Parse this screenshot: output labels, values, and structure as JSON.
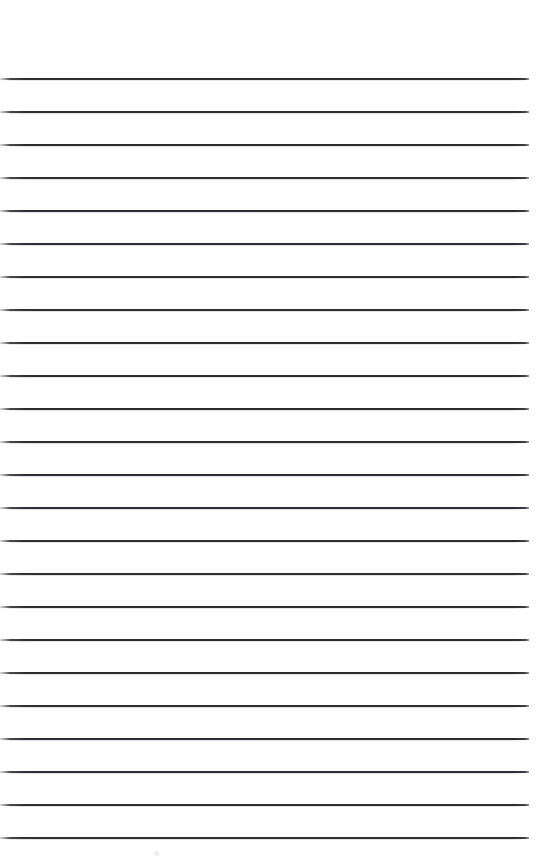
{
  "page": {
    "kind": "scanned-blank-ruled-notebook-page",
    "width": 536,
    "height": 863,
    "background_color": "#ffffff",
    "rule_color": "#2e2e32",
    "rule_faded_edge_color": "#78787c",
    "rule_thickness_px": 2,
    "rule_spacing_px": 33,
    "top_margin_px": 78,
    "bottom_margin_px": 27,
    "rule_left_x": 0,
    "rule_right_x": 529,
    "rule_count": 24,
    "text_content": "",
    "notes_visible": "none - page is blank, no handwriting or printed text"
  },
  "rules": [
    {
      "index": 1,
      "y": 78,
      "left": 0,
      "width": 529
    },
    {
      "index": 2,
      "y": 111,
      "left": 0,
      "width": 529
    },
    {
      "index": 3,
      "y": 144,
      "left": 0,
      "width": 529
    },
    {
      "index": 4,
      "y": 177,
      "left": 0,
      "width": 529
    },
    {
      "index": 5,
      "y": 210,
      "left": 0,
      "width": 529
    },
    {
      "index": 6,
      "y": 243,
      "left": 0,
      "width": 529
    },
    {
      "index": 7,
      "y": 276,
      "left": 0,
      "width": 529
    },
    {
      "index": 8,
      "y": 309,
      "left": 0,
      "width": 529
    },
    {
      "index": 9,
      "y": 342,
      "left": 0,
      "width": 529
    },
    {
      "index": 10,
      "y": 375,
      "left": 0,
      "width": 529
    },
    {
      "index": 11,
      "y": 408,
      "left": 0,
      "width": 529
    },
    {
      "index": 12,
      "y": 441,
      "left": 0,
      "width": 529
    },
    {
      "index": 13,
      "y": 474,
      "left": 0,
      "width": 529
    },
    {
      "index": 14,
      "y": 507,
      "left": 0,
      "width": 529
    },
    {
      "index": 15,
      "y": 540,
      "left": 0,
      "width": 529
    },
    {
      "index": 16,
      "y": 573,
      "left": 0,
      "width": 529
    },
    {
      "index": 17,
      "y": 606,
      "left": 0,
      "width": 529
    },
    {
      "index": 18,
      "y": 639,
      "left": 0,
      "width": 529
    },
    {
      "index": 19,
      "y": 672,
      "left": 0,
      "width": 529
    },
    {
      "index": 20,
      "y": 705,
      "left": 0,
      "width": 529
    },
    {
      "index": 21,
      "y": 738,
      "left": 0,
      "width": 529
    },
    {
      "index": 22,
      "y": 771,
      "left": 0,
      "width": 529
    },
    {
      "index": 23,
      "y": 804,
      "left": 0,
      "width": 529
    },
    {
      "index": 24,
      "y": 837,
      "left": 0,
      "width": 529
    }
  ],
  "artifacts": [
    {
      "name": "paper-smudge",
      "x": 153,
      "y": 850,
      "size": 7
    }
  ]
}
